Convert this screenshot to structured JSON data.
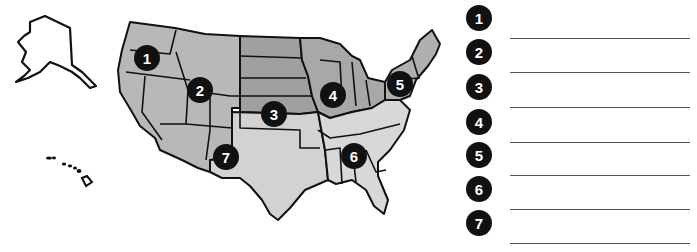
{
  "map": {
    "title": "United States regions map",
    "colors": {
      "region_dark": "#9a9a9a",
      "region_mid": "#b4b4b4",
      "region_light": "#cfcfcf",
      "border": "#111111",
      "marker_bg": "#111111",
      "marker_text": "#ffffff"
    },
    "markers": [
      {
        "label": "1",
        "region": "Pacific Northwest"
      },
      {
        "label": "2",
        "region": "Mountain / Rockies"
      },
      {
        "label": "3",
        "region": "Great Plains"
      },
      {
        "label": "4",
        "region": "Midwest / Great Lakes"
      },
      {
        "label": "5",
        "region": "Northeast"
      },
      {
        "label": "6",
        "region": "Southeast"
      },
      {
        "label": "7",
        "region": "Southwest"
      }
    ]
  },
  "answers": {
    "items": [
      {
        "label": "1",
        "value": ""
      },
      {
        "label": "2",
        "value": ""
      },
      {
        "label": "3",
        "value": ""
      },
      {
        "label": "4",
        "value": ""
      },
      {
        "label": "5",
        "value": ""
      },
      {
        "label": "6",
        "value": ""
      },
      {
        "label": "7",
        "value": ""
      }
    ]
  }
}
